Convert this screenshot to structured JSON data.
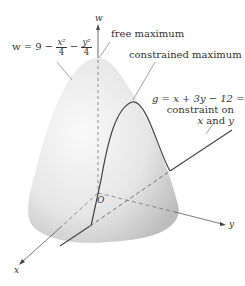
{
  "figure": {
    "axes": {
      "w_label": "w",
      "x_label": "x",
      "y_label": "y",
      "origin_label": "O"
    },
    "surface": {
      "equation_prefix": "w = 9 −",
      "term1_num": "x²",
      "term1_den": "4",
      "minus": "−",
      "term2_num": "y²",
      "term2_den": "4"
    },
    "annotations": {
      "free_maximum": "free maximum",
      "constrained_maximum": "constrained maximum",
      "constraint_equation": "g = x + 3y − 12 = 0",
      "constraint_line1": "constraint on",
      "constraint_line2_x": "x",
      "constraint_line2_and": " and ",
      "constraint_line2_y": "y"
    },
    "colors": {
      "surface_light": "#f4f4f4",
      "surface_dark": "#c8c8c8",
      "line": "#444444"
    }
  }
}
